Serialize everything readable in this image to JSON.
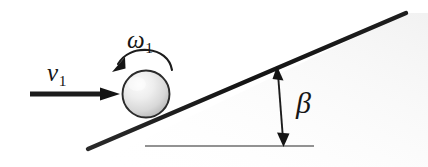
{
  "figure": {
    "width": 428,
    "height": 167,
    "background_color": "#ffffff",
    "ink_color": "#1a1a1a"
  },
  "labels": {
    "velocity": {
      "symbol": "v",
      "subscript": "1",
      "text": "v1",
      "meaning": "initial translational velocity"
    },
    "angular_velocity": {
      "symbol": "ω",
      "subscript": "1",
      "text": "ω1",
      "meaning": "initial angular velocity"
    },
    "incline_angle": {
      "symbol": "β",
      "text": "β",
      "meaning": "inclination angle of the ramp"
    }
  },
  "elements": {
    "sphere": {
      "name": "ball",
      "center_x": 146,
      "center_y": 94,
      "radius": 24,
      "fill_light": "#f6f6f6",
      "fill_dark": "#b8b8b8",
      "stroke": "#2b2b2b"
    },
    "incline": {
      "name": "inclined-plane",
      "x1": 88,
      "y1": 149,
      "x2": 406,
      "y2": 13,
      "stroke": "#1c1c1c",
      "stroke_width": 4.2
    },
    "ground_line": {
      "name": "horizontal-reference",
      "x1": 145,
      "y1": 146,
      "x2": 314,
      "y2": 146,
      "stroke": "#6e6e6e",
      "stroke_width": 1.4
    },
    "velocity_arrow": {
      "name": "velocity-vector",
      "x1": 30,
      "y1": 94,
      "x2": 114,
      "y2": 94,
      "stroke": "#1c1c1c",
      "stroke_width": 5
    },
    "spin_arrow": {
      "name": "angular-velocity-arc",
      "direction": "counterclockwise",
      "stroke": "#1c1c1c",
      "stroke_width": 2
    },
    "angle_arrow": {
      "name": "angle-indicator",
      "x1": 277,
      "y1": 68,
      "x2": 283,
      "y2": 145,
      "double_headed": true,
      "stroke": "#1c1c1c",
      "stroke_width": 1.8
    }
  }
}
